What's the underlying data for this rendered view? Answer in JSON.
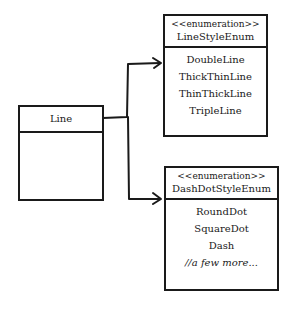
{
  "diagram": {
    "classes": [
      {
        "id": "line",
        "name": "Line",
        "stereotype": null,
        "attributes": []
      },
      {
        "id": "line-style-enum",
        "name": "LineStyleEnum",
        "stereotype": "<<enumeration>>",
        "values": [
          "DoubleLine",
          "ThickThinLine",
          "ThinThickLine",
          "TripleLine"
        ]
      },
      {
        "id": "dash-dot-style-enum",
        "name": "DashDotStyleEnum",
        "stereotype": "<<enumeration>>",
        "values": [
          "RoundDot",
          "SquareDot",
          "Dash",
          "//a few more..."
        ]
      }
    ],
    "associations": [
      {
        "from": "Line",
        "to": "LineStyleEnum",
        "type": "directed"
      },
      {
        "from": "Line",
        "to": "DashDotStyleEnum",
        "type": "directed"
      }
    ],
    "colors": {
      "stroke": "#1a1a1a",
      "background": "#ffffff"
    }
  }
}
